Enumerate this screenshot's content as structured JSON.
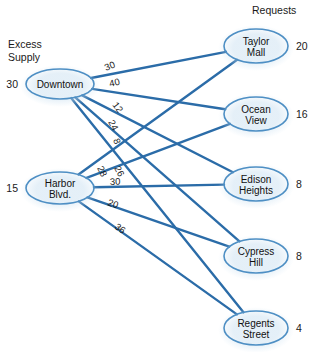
{
  "headers": {
    "supply_label_line1": "Excess",
    "supply_label_line2": "Supply",
    "demand_label": "Requests"
  },
  "supply_nodes": [
    {
      "id": "downtown",
      "label_line1": "Downtown",
      "label_line2": "",
      "amount": "30",
      "cx": 60,
      "cy": 84,
      "rx": 34,
      "ry": 15
    },
    {
      "id": "harbor-blvd",
      "label_line1": "Harbor",
      "label_line2": "Blvd.",
      "amount": "15",
      "cx": 60,
      "cy": 188,
      "rx": 34,
      "ry": 16
    }
  ],
  "demand_nodes": [
    {
      "id": "taylor-mall",
      "label_line1": "Taylor",
      "label_line2": "Mall",
      "amount": "20",
      "cx": 256,
      "cy": 46,
      "rx": 32,
      "ry": 17
    },
    {
      "id": "ocean-view",
      "label_line1": "Ocean",
      "label_line2": "View",
      "amount": "16",
      "cx": 256,
      "cy": 114,
      "rx": 32,
      "ry": 17
    },
    {
      "id": "edison-heights",
      "label_line1": "Edison",
      "label_line2": "Heights",
      "amount": "8",
      "cx": 256,
      "cy": 184,
      "rx": 32,
      "ry": 17
    },
    {
      "id": "cypress-hill",
      "label_line1": "Cypress",
      "label_line2": "Hill",
      "amount": "8",
      "cx": 256,
      "cy": 256,
      "rx": 32,
      "ry": 17
    },
    {
      "id": "regents-street",
      "label_line1": "Regents",
      "label_line2": "Street",
      "amount": "4",
      "cx": 256,
      "cy": 328,
      "rx": 32,
      "ry": 17
    }
  ],
  "edges": [
    {
      "id": "downtown-taylor-mall",
      "from": "downtown",
      "to": "taylor-mall",
      "cost": "30",
      "lx": 106,
      "ly": 71,
      "rot": -22
    },
    {
      "id": "downtown-ocean-view",
      "from": "downtown",
      "to": "ocean-view",
      "cost": "40",
      "lx": 110,
      "ly": 87,
      "rot": -13
    },
    {
      "id": "downtown-edison-heights",
      "from": "downtown",
      "to": "edison-heights",
      "cost": "12",
      "lx": 112,
      "ly": 105,
      "rot": 53
    },
    {
      "id": "downtown-cypress-hill",
      "from": "downtown",
      "to": "cypress-hill",
      "cost": "24",
      "lx": 108,
      "ly": 122,
      "rot": 62
    },
    {
      "id": "downtown-regents-street",
      "from": "downtown",
      "to": "regents-street",
      "cost": "8",
      "lx": 113,
      "ly": 140,
      "rot": 68
    },
    {
      "id": "harbor-taylor-mall",
      "from": "harbor-blvd",
      "to": "taylor-mall",
      "cost": "28",
      "lx": 97,
      "ly": 168,
      "rot": 64
    },
    {
      "id": "harbor-ocean-view",
      "from": "harbor-blvd",
      "to": "ocean-view",
      "cost": "26",
      "lx": 114,
      "ly": 168,
      "rot": 62
    },
    {
      "id": "harbor-edison-heights",
      "from": "harbor-blvd",
      "to": "edison-heights",
      "cost": "30",
      "lx": 110,
      "ly": 185,
      "rot": -2
    },
    {
      "id": "harbor-cypress-hill",
      "from": "harbor-blvd",
      "to": "cypress-hill",
      "cost": "20",
      "lx": 107,
      "ly": 205,
      "rot": 20
    },
    {
      "id": "harbor-regents-street",
      "from": "harbor-blvd",
      "to": "regents-street",
      "cost": "36",
      "lx": 114,
      "ly": 228,
      "rot": 36
    }
  ],
  "colors": {
    "edge": "#2b6ca8",
    "node_border": "#4e8fc4",
    "node_fill_light": "#f4fafe",
    "node_fill_mid": "#cfe4f4",
    "text": "#1a1a1a"
  }
}
